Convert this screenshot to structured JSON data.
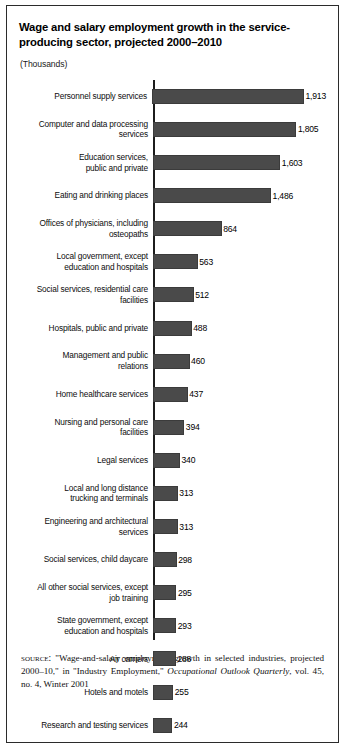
{
  "figure": {
    "title": "Wage and salary employment growth in the service-producing sector, projected 2000–2010",
    "units": "(Thousands)",
    "source_keyword": "source:",
    "source_part1": " \"Wage-and-salary employment growth in selected industries, projected 2000–10,\" in \"Industry Employment,\" ",
    "source_italic": "Occupational Outlook Quarterly",
    "source_part2": ", vol. 45, no. 4, Winter 2001"
  },
  "colors": {
    "bar": "#4a4a4a",
    "axis": "#1c1c1c",
    "border": "#2b2b2b",
    "background": "#ffffff"
  },
  "chart_data": {
    "type": "bar",
    "orientation": "horizontal",
    "title": "Wage and salary employment growth in the service-producing sector, projected 2000–2010",
    "subtitle": "",
    "xlabel": "",
    "ylabel": "",
    "units": "Thousands",
    "grid": false,
    "legend": "none",
    "xlim": [
      0,
      1913
    ],
    "categories": [
      "Personnel supply services",
      "Computer and data processing services",
      "Education services, public and private",
      "Eating and drinking places",
      "Offices of physicians, including osteopaths",
      "Local government, except education and hospitals",
      "Social services, residential care facilities",
      "Hospitals, public and private",
      "Management and public relations",
      "Home healthcare services",
      "Nursing and personal care facilities",
      "Legal services",
      "Local and long distance trucking and terminals",
      "Engineering and architectural services",
      "Social services, child daycare",
      "All other social services, except job training",
      "State government, except education and hospitals",
      "Air carriers",
      "Hotels and motels",
      "Research and testing services"
    ],
    "values": [
      1913,
      1805,
      1603,
      1486,
      864,
      563,
      512,
      488,
      460,
      437,
      394,
      340,
      313,
      313,
      298,
      295,
      293,
      288,
      255,
      244
    ],
    "value_labels": [
      "1,913",
      "1,805",
      "1,603",
      "1,486",
      "864",
      "563",
      "512",
      "488",
      "460",
      "437",
      "394",
      "340",
      "313",
      "313",
      "298",
      "295",
      "293",
      "288",
      "255",
      "244"
    ]
  },
  "rows": [
    {
      "label": "Personnel supply services",
      "value_label": "1,913",
      "value": 1913
    },
    {
      "label": "Computer and data processing\nservices",
      "value_label": "1,805",
      "value": 1805
    },
    {
      "label": "Education services,\npublic and private",
      "value_label": "1,603",
      "value": 1603
    },
    {
      "label": "Eating and drinking places",
      "value_label": "1,486",
      "value": 1486
    },
    {
      "label": "Offices of physicians, including\nosteopaths",
      "value_label": "864",
      "value": 864
    },
    {
      "label": "Local government, except\neducation and hospitals",
      "value_label": "563",
      "value": 563
    },
    {
      "label": "Social services, residential care\nfacilities",
      "value_label": "512",
      "value": 512
    },
    {
      "label": "Hospitals, public and private",
      "value_label": "488",
      "value": 488
    },
    {
      "label": "Management and public\nrelations",
      "value_label": "460",
      "value": 460
    },
    {
      "label": "Home healthcare services",
      "value_label": "437",
      "value": 437
    },
    {
      "label": "Nursing and personal care\nfacilities",
      "value_label": "394",
      "value": 394
    },
    {
      "label": "Legal services",
      "value_label": "340",
      "value": 340
    },
    {
      "label": "Local and long distance\ntrucking and terminals",
      "value_label": "313",
      "value": 313
    },
    {
      "label": "Engineering and architectural\nservices",
      "value_label": "313",
      "value": 313
    },
    {
      "label": "Social services, child daycare",
      "value_label": "298",
      "value": 298
    },
    {
      "label": "All other social services, except\njob training",
      "value_label": "295",
      "value": 295
    },
    {
      "label": "State government, except\neducation and hospitals",
      "value_label": "293",
      "value": 293
    },
    {
      "label": "Air carriers",
      "value_label": "288",
      "value": 288
    },
    {
      "label": "Hotels and motels",
      "value_label": "255",
      "value": 255
    },
    {
      "label": "Research and testing services",
      "value_label": "244",
      "value": 244
    }
  ]
}
